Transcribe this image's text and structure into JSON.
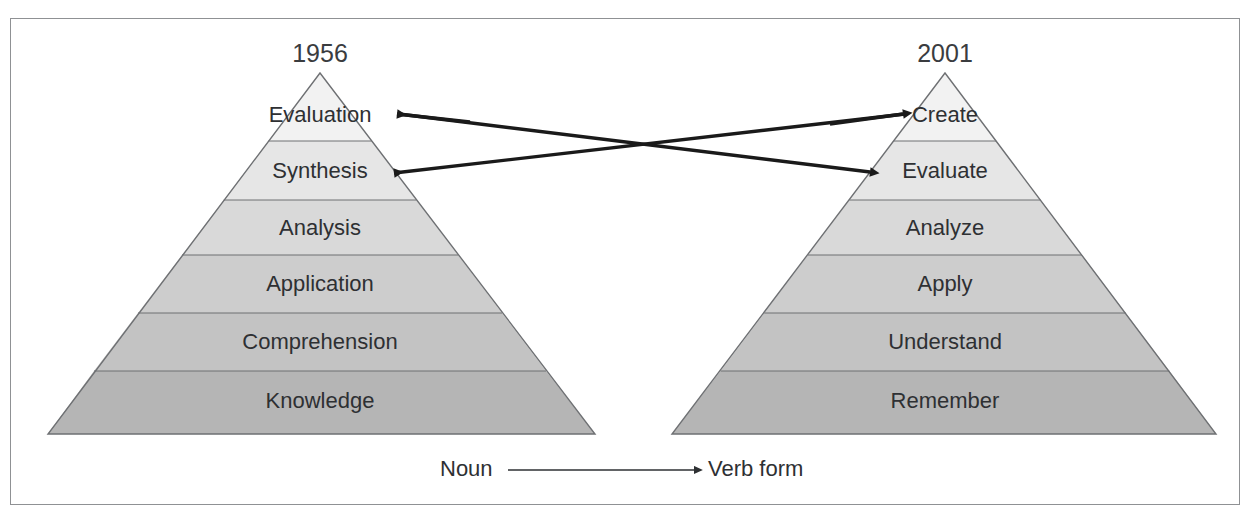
{
  "figure": {
    "border_color": "#8f9194",
    "background": "#ffffff"
  },
  "pyramids": [
    {
      "id": "original-1956",
      "year_label": "1956",
      "apex": {
        "x": 320,
        "y": 73
      },
      "base": {
        "left_x": 48,
        "right_x": 595,
        "y": 434
      },
      "tiers": [
        {
          "label": "Evaluation",
          "index": 0,
          "fill": "#f2f2f2",
          "center_y": 116
        },
        {
          "label": "Synthesis",
          "index": 1,
          "fill": "#e6e6e6",
          "center_y": 172
        },
        {
          "label": "Analysis",
          "index": 2,
          "fill": "#d9d9d9",
          "center_y": 229
        },
        {
          "label": "Application",
          "index": 3,
          "fill": "#cdcdcd",
          "center_y": 285
        },
        {
          "label": "Comprehension",
          "index": 4,
          "fill": "#c3c3c3",
          "center_y": 343
        },
        {
          "label": "Knowledge",
          "index": 5,
          "fill": "#b5b5b5",
          "center_y": 402
        }
      ],
      "divider_y": [
        141,
        200,
        255,
        313,
        371
      ]
    },
    {
      "id": "revised-2001",
      "year_label": "2001",
      "apex": {
        "x": 945,
        "y": 73
      },
      "base": {
        "left_x": 672,
        "right_x": 1216,
        "y": 434
      },
      "tiers": [
        {
          "label": "Create",
          "index": 0,
          "fill": "#f2f2f2",
          "center_y": 116
        },
        {
          "label": "Evaluate",
          "index": 1,
          "fill": "#e6e6e6",
          "center_y": 172
        },
        {
          "label": "Analyze",
          "index": 2,
          "fill": "#d9d9d9",
          "center_y": 229
        },
        {
          "label": "Apply",
          "index": 3,
          "fill": "#cdcdcd",
          "center_y": 285
        },
        {
          "label": "Understand",
          "index": 4,
          "fill": "#c3c3c3",
          "center_y": 343
        },
        {
          "label": "Remember",
          "index": 5,
          "fill": "#b5b5b5",
          "center_y": 402
        }
      ],
      "divider_y": [
        141,
        200,
        255,
        313,
        371
      ]
    }
  ],
  "mapping_arrows": [
    {
      "id": "evaluation-to-evaluate",
      "from_label": "Evaluation",
      "to_label": "Evaluate",
      "direction": "left-to-right",
      "start": {
        "x": 399,
        "y": 114
      },
      "end": {
        "x": 872,
        "y": 172
      },
      "color": "#1a1a1a"
    },
    {
      "id": "create-to-synthesis",
      "from_label": "Create",
      "to_label": "Synthesis",
      "direction": "right-to-left",
      "start": {
        "x": 905,
        "y": 114
      },
      "end": {
        "x": 392,
        "y": 173
      },
      "color": "#1a1a1a"
    }
  ],
  "legend": {
    "left_label": "Noun",
    "right_label": "Verb form",
    "arrow": {
      "x1": 508,
      "y1": 470,
      "x2": 700,
      "y2": 470
    },
    "color": "#2e3033"
  },
  "colors": {
    "text": "#2e3033",
    "year_text": "#3a3c3f",
    "tier_edge": "#6e7073",
    "arrow": "#1a1a1a",
    "border": "#8f9194"
  }
}
